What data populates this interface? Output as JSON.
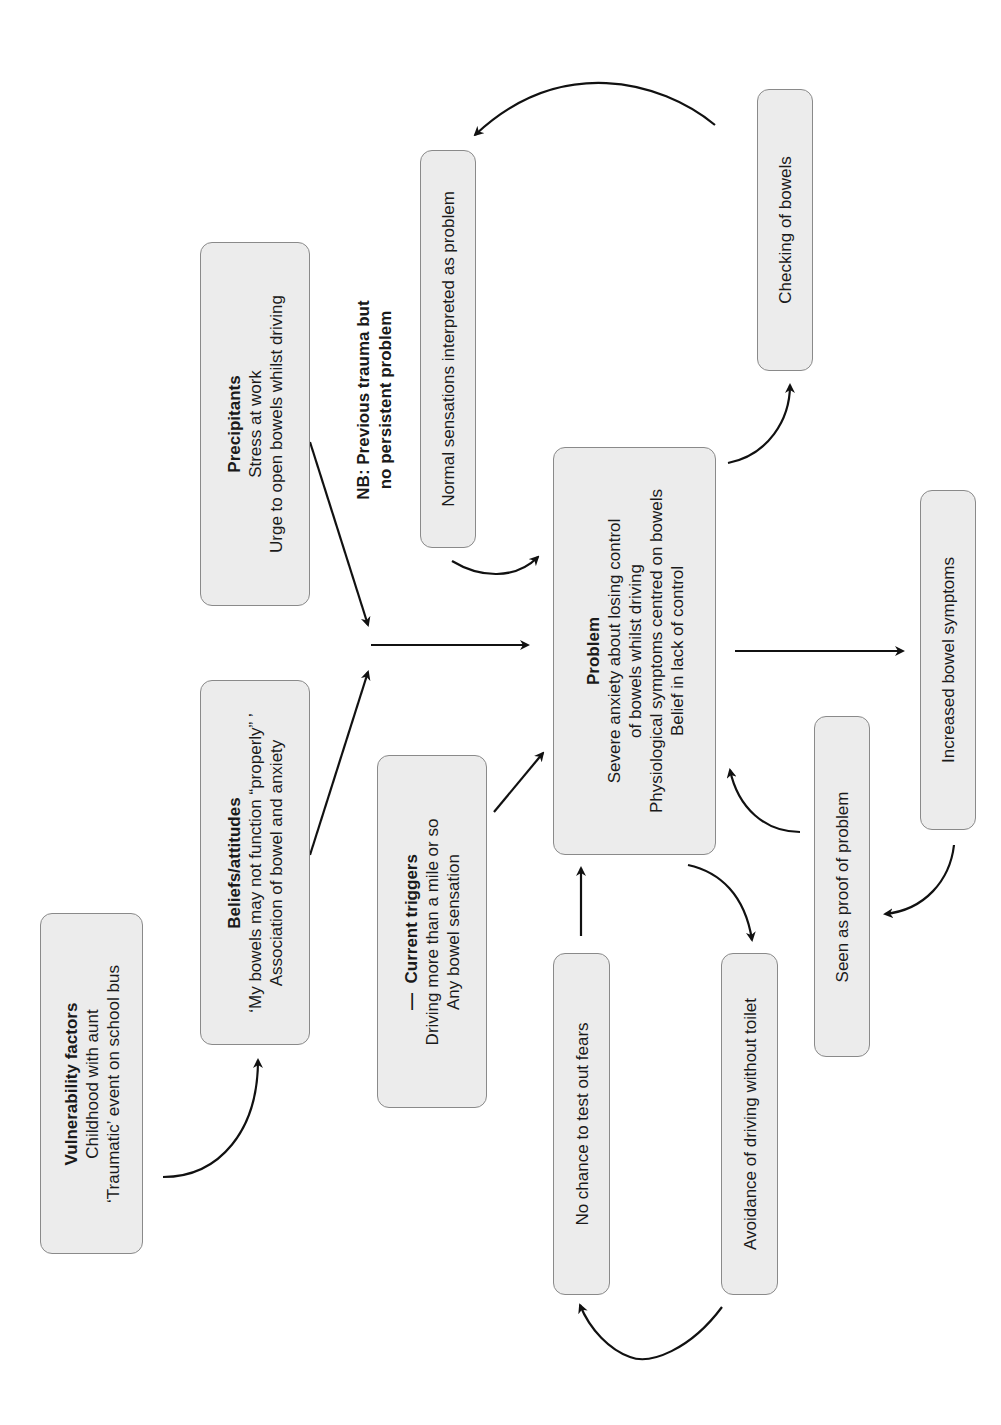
{
  "diagram": {
    "orientation": "rotated-90-ccw",
    "nodes": {
      "vulnerability": {
        "title": "Vulnerability factors",
        "lines": [
          "Childhood with aunt",
          "‘Traumatic’ event on school bus"
        ]
      },
      "beliefs": {
        "title": "Beliefs/attitudes",
        "lines": [
          "‘My bowels may not function “properly” ’",
          "Association of bowel and anxiety"
        ]
      },
      "precipitants": {
        "title": "Precipitants",
        "lines": [
          "Stress at work",
          "Urge to open bowels whilst driving"
        ]
      },
      "note": {
        "lines": [
          "NB: Previous trauma but",
          "no persistent problem"
        ]
      },
      "triggers": {
        "marker": "—",
        "title": "Current triggers",
        "lines": [
          "Driving more than a mile or so",
          "Any bowel sensation"
        ]
      },
      "problem": {
        "title": "Problem",
        "lines": [
          "Severe anxiety about losing control",
          "of bowels whilst driving",
          "Physiological symptoms centred on bowels",
          "Belief in lack of control"
        ]
      },
      "normal_sensations": {
        "label": "Normal sensations interpreted as problem"
      },
      "checking": {
        "label": "Checking of bowels"
      },
      "increased": {
        "label": "Increased bowel symptoms"
      },
      "proof": {
        "label": "Seen as proof of problem"
      },
      "no_chance": {
        "label": "No chance to test out fears"
      },
      "avoidance": {
        "label": "Avoidance of driving without toilet"
      }
    },
    "edges": [
      {
        "from": "vulnerability",
        "to": "beliefs"
      },
      {
        "from": "beliefs",
        "to": "junction"
      },
      {
        "from": "precipitants",
        "to": "junction"
      },
      {
        "from": "junction",
        "to": "problem"
      },
      {
        "from": "triggers",
        "to": "problem"
      },
      {
        "from": "normal_sensations",
        "to": "problem"
      },
      {
        "from": "problem",
        "to": "checking"
      },
      {
        "from": "checking",
        "to": "normal_sensations"
      },
      {
        "from": "problem",
        "to": "increased"
      },
      {
        "from": "increased",
        "to": "proof"
      },
      {
        "from": "proof",
        "to": "problem"
      },
      {
        "from": "problem",
        "to": "avoidance"
      },
      {
        "from": "avoidance",
        "to": "no_chance"
      },
      {
        "from": "no_chance",
        "to": "problem"
      }
    ],
    "colors": {
      "box_fill": "#ececec",
      "box_border": "#8a8a8a",
      "arrow": "#111111",
      "text": "#1a1a1a"
    }
  }
}
